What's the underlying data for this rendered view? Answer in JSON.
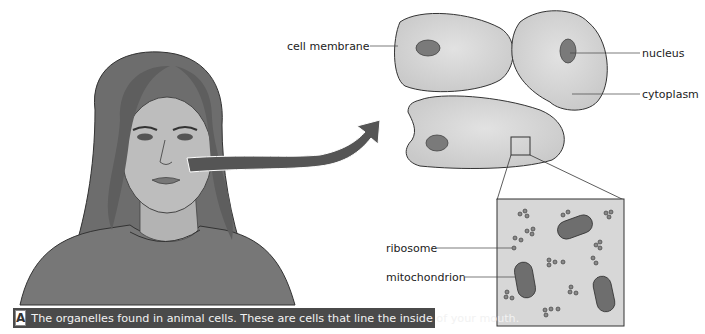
{
  "figure": {
    "caption_letter": "A",
    "caption_text": "The organelles found in animal cells. These are cells that line the inside of your mouth."
  },
  "labels": {
    "cell_membrane": "cell membrane",
    "nucleus": "nucleus",
    "cytoplasm": "cytoplasm",
    "ribosome": "ribosome",
    "mitochondrion": "mitochondrion"
  },
  "colors": {
    "cell_fill": "#d9d9d9",
    "nucleus_fill": "#7a7a7a",
    "caption_bg": "#4a4a4a",
    "arrow": "#555555"
  }
}
